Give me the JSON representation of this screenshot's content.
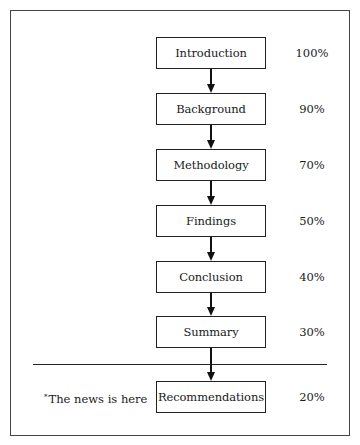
{
  "diagram": {
    "steps": [
      {
        "label": "Introduction",
        "percent": "100%"
      },
      {
        "label": "Background",
        "percent": "90%"
      },
      {
        "label": "Methodology",
        "percent": "70%"
      },
      {
        "label": "Findings",
        "percent": "50%"
      },
      {
        "label": "Conclusion",
        "percent": "40%"
      },
      {
        "label": "Summary",
        "percent": "30%"
      },
      {
        "label": "Recommendations",
        "percent": "20%"
      }
    ],
    "note": {
      "marker": "*",
      "text": "The news is here"
    }
  }
}
